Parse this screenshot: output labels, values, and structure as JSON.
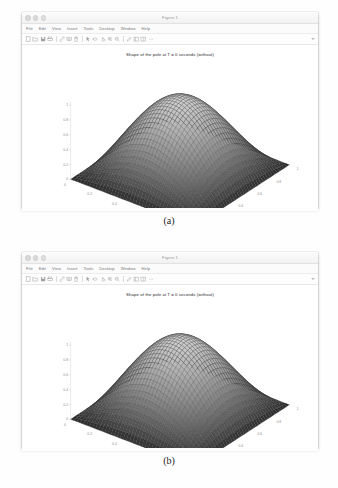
{
  "figure_a": {
    "window_title": "Figure 1",
    "menu": [
      "File",
      "Edit",
      "View",
      "Insert",
      "Tools",
      "Desktop",
      "Window",
      "Help"
    ],
    "toolbar_icons": [
      "new-figure-icon",
      "open-folder-icon",
      "save-icon",
      "print-icon",
      "link-plot-icon",
      "insert-legend-icon",
      "insert-colorbar-icon",
      "data-cursor-icon",
      "rotate-3d-icon",
      "pan-icon",
      "zoom-out-icon",
      "zoom-in-icon",
      "edit-plot-icon",
      "show-plot-tools-icon",
      "hide-plot-tools-icon",
      "more-options-icon"
    ],
    "plot_title": "Shape of the pole at T = 0 seconds (without)",
    "caption": "(a)"
  },
  "figure_b": {
    "window_title": "Figure 1",
    "menu": [
      "File",
      "Edit",
      "View",
      "Insert",
      "Tools",
      "Desktop",
      "Window",
      "Help"
    ],
    "toolbar_icons": [
      "new-figure-icon",
      "open-folder-icon",
      "save-icon",
      "print-icon",
      "link-plot-icon",
      "insert-legend-icon",
      "insert-colorbar-icon",
      "data-cursor-icon",
      "rotate-3d-icon",
      "pan-icon",
      "zoom-out-icon",
      "zoom-in-icon",
      "edit-plot-icon",
      "show-plot-tools-icon",
      "hide-plot-tools-icon",
      "more-options-icon"
    ],
    "plot_title": "Shape of the pole at T = 0 seconds (without)",
    "caption": "(b)"
  },
  "chart_data": [
    {
      "type": "surface",
      "id": "surface-a",
      "title": "Shape of the pole at T = 0 seconds (without)",
      "xlabel": "",
      "ylabel": "",
      "zlabel": "",
      "grid": true,
      "legend": "none",
      "mesh": {
        "rows": 41,
        "cols": 41,
        "style": "wireframe-mesh",
        "shading": "grayscale"
      },
      "xlim": [
        0,
        1
      ],
      "ylim": [
        0,
        1
      ],
      "zlim": [
        0,
        1
      ],
      "z_ticks": [
        "0",
        "0.2",
        "0.4",
        "0.6",
        "0.8",
        "1"
      ],
      "x_ticks": [
        "0",
        "0.2",
        "0.4",
        "0.6",
        "0.8",
        "1"
      ],
      "y_ticks": [
        "0",
        "0.2",
        "0.4",
        "0.6",
        "0.8",
        "1"
      ],
      "function": "z = sin(pi*x) * sin(pi*y)",
      "peak_value": 1.0,
      "peak_at": [
        0.5,
        0.5
      ],
      "view_azimuth": -37.5,
      "view_elevation": 30,
      "colors": {
        "edge": "#303030",
        "face": "#b5b5b5",
        "base": "#1a1a1a"
      }
    },
    {
      "type": "surface",
      "id": "surface-b",
      "title": "Shape of the pole at T = 0 seconds (without)",
      "xlabel": "",
      "ylabel": "",
      "zlabel": "",
      "grid": true,
      "legend": "none",
      "mesh": {
        "rows": 41,
        "cols": 41,
        "style": "wireframe-mesh",
        "shading": "grayscale"
      },
      "xlim": [
        0,
        1
      ],
      "ylim": [
        0,
        1
      ],
      "zlim": [
        0,
        1
      ],
      "z_ticks": [
        "0",
        "0.2",
        "0.4",
        "0.6",
        "0.8",
        "1"
      ],
      "x_ticks": [
        "0",
        "0.2",
        "0.4",
        "0.6",
        "0.8",
        "1"
      ],
      "y_ticks": [
        "0",
        "0.2",
        "0.4",
        "0.6",
        "0.8",
        "1"
      ],
      "function": "z = sin(pi*x) * sin(pi*y)",
      "peak_value": 1.0,
      "peak_at": [
        0.5,
        0.5
      ],
      "view_azimuth": -37.5,
      "view_elevation": 30,
      "colors": {
        "edge": "#303030",
        "face": "#b5b5b5",
        "base": "#1a1a1a"
      }
    }
  ]
}
